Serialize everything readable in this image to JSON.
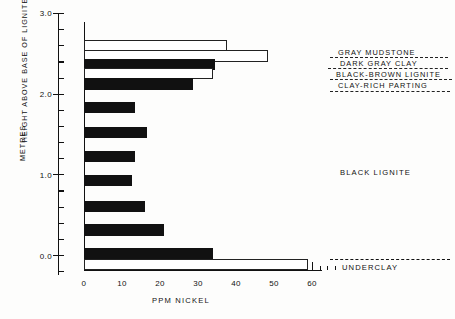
{
  "chart_data": {
    "type": "bar",
    "orientation": "horizontal",
    "title": "",
    "xlabel": "PPM NICKEL",
    "ylabel": "HEIGHT ABOVE BASE OF LIGNITE",
    "ylabel_units": "METRES",
    "xlim": [
      0,
      66
    ],
    "ylim": [
      -0.25,
      3.0
    ],
    "x_major_ticks": [
      0,
      10,
      20,
      30,
      40,
      50,
      60
    ],
    "x_tick_labels": [
      "0",
      "10",
      "20",
      "30",
      "40",
      "50",
      "60"
    ],
    "x_minor_tick_step": 2,
    "y_major_ticks": [
      0.0,
      1.0,
      2.0,
      3.0
    ],
    "y_tick_labels": [
      "0.0",
      "1.0",
      "2.0",
      "3.0"
    ],
    "y_minor_tick_step": 0.2,
    "grid": false,
    "legend": "none",
    "series": [
      {
        "name": "PPM Nickel by sample interval",
        "samples": [
          {
            "height": 2.6,
            "value": 37.5,
            "fill": "white",
            "unit": "GRAY MUDSTONE"
          },
          {
            "height": 2.47,
            "value": 48.5,
            "fill": "white",
            "unit": "DARK GRAY CLAY"
          },
          {
            "height": 2.36,
            "value": 34.5,
            "fill": "black",
            "unit": "BLACK-BROWN LIGNITE"
          },
          {
            "height": 2.25,
            "value": 34.0,
            "fill": "white",
            "unit": "CLAY-RICH PARTING"
          },
          {
            "height": 2.12,
            "value": 28.7,
            "fill": "black",
            "unit": "BLACK LIGNITE"
          },
          {
            "height": 1.83,
            "value": 13.5,
            "fill": "black",
            "unit": "BLACK LIGNITE"
          },
          {
            "height": 1.52,
            "value": 16.5,
            "fill": "black",
            "unit": "BLACK LIGNITE"
          },
          {
            "height": 1.22,
            "value": 13.5,
            "fill": "black",
            "unit": "BLACK LIGNITE"
          },
          {
            "height": 0.92,
            "value": 12.5,
            "fill": "black",
            "unit": "BLACK LIGNITE"
          },
          {
            "height": 0.6,
            "value": 16.0,
            "fill": "black",
            "unit": "BLACK LIGNITE"
          },
          {
            "height": 0.31,
            "value": 21.0,
            "fill": "black",
            "unit": "BLACK LIGNITE"
          },
          {
            "height": 0.02,
            "value": 34.0,
            "fill": "black",
            "unit": "BLACK LIGNITE"
          },
          {
            "height": -0.12,
            "value": 59.0,
            "fill": "white",
            "unit": "UNDERCLAY"
          }
        ]
      }
    ],
    "annotations": [
      {
        "text": "GRAY MUDSTONE",
        "style": "leader-dashed"
      },
      {
        "text": "DARK GRAY CLAY",
        "style": "leader-dashed"
      },
      {
        "text": "BLACK-BROWN LIGNITE",
        "style": "leader-dashed"
      },
      {
        "text": "CLAY-RICH PARTING",
        "style": "leader-dashed"
      },
      {
        "text": "BLACK LIGNITE",
        "style": "plain"
      },
      {
        "text": "UNDERCLAY",
        "style": "leader-dashed"
      }
    ]
  },
  "axes": {
    "y_title_line1": "HEIGHT ABOVE BASE OF LIGNITE",
    "y_title_line2": "METRES",
    "x_title": "PPM NICKEL"
  },
  "ytick_labels": {
    "t0": "3.0",
    "t1": "2.0",
    "t2": "1.0",
    "t3": "0.0"
  },
  "xtick_labels": {
    "t0": "0",
    "t1": "10",
    "t2": "20",
    "t3": "30",
    "t4": "40",
    "t5": "50",
    "t6": "60"
  },
  "strat_labels": {
    "gray_mudstone": "GRAY MUDSTONE",
    "dark_gray_clay": "DARK GRAY CLAY",
    "black_brown_lignite": "BLACK-BROWN LIGNITE",
    "clay_rich_parting": "CLAY-RICH PARTING",
    "black_lignite": "BLACK LIGNITE",
    "underclay": "UNDERCLAY"
  },
  "colors": {
    "ink": "#111111",
    "paper": "#fdfdfc",
    "bar_black": "#111111",
    "bar_white": "#ffffff"
  }
}
